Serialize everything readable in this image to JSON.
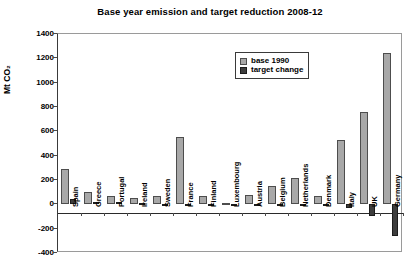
{
  "chart_data": {
    "type": "bar",
    "title": "Base year emission and target reduction 2008-12",
    "xlabel": "",
    "ylabel": "Mt CO₂",
    "ylim": [
      -400,
      1400
    ],
    "ytick_step": 200,
    "yticks": [
      1400,
      1200,
      1000,
      800,
      600,
      400,
      200,
      0,
      -200,
      -400
    ],
    "ytick_labels": [
      "1400",
      "1200",
      "1000",
      "800",
      "600",
      "400",
      "200",
      "0",
      "-200",
      "-400"
    ],
    "grid": false,
    "legend_position": "upper-center-right",
    "categories": [
      "Spain",
      "Greece",
      "Portugal",
      "Ireland",
      "Sweden",
      "France",
      "Finland",
      "Luxembourg",
      "Austria",
      "Belgium",
      "Netherlands",
      "Denmark",
      "Italy",
      "UK",
      "Germany"
    ],
    "series": [
      {
        "name": "base 1990",
        "color": "#a8a8a8",
        "values": [
          290,
          105,
          65,
          55,
          70,
          555,
          70,
          13,
          80,
          150,
          215,
          70,
          530,
          760,
          1240
        ]
      },
      {
        "name": "target change",
        "color": "#3d3d3d",
        "values": [
          45,
          16,
          18,
          8,
          3,
          0,
          0,
          -4,
          -10,
          -12,
          -12,
          -15,
          -34,
          -95,
          -260
        ]
      }
    ]
  },
  "legend": {
    "items": [
      {
        "label": "base 1990",
        "swatch": "light-gray-square"
      },
      {
        "label": "target change",
        "swatch": "dark-square"
      }
    ]
  }
}
